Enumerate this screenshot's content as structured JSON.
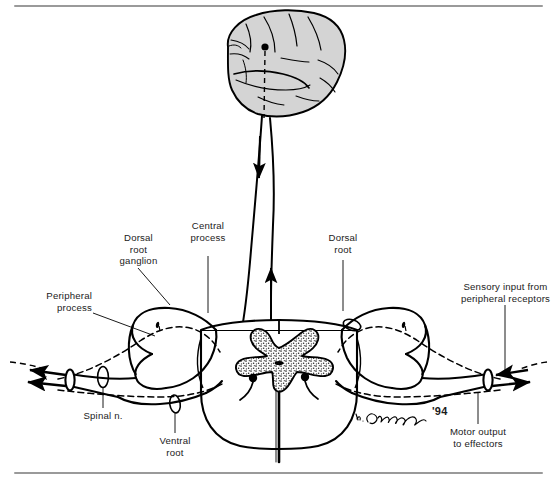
{
  "figure": {
    "signature": "d. Cummings",
    "signature_year": "'94",
    "colors": {
      "ink": "#000000",
      "brain_fill": "#d4d4d4",
      "gray_matter_fill": "#7d7d7d",
      "rule": "#9a9a9a",
      "paper": "#ffffff"
    }
  },
  "labels": [
    {
      "id": "dorsal-root-ganglion",
      "text_lines": [
        "Dorsal",
        "root",
        "ganglion"
      ],
      "align": "center"
    },
    {
      "id": "central-process",
      "text_lines": [
        "Central",
        "process"
      ],
      "align": "center"
    },
    {
      "id": "dorsal-root",
      "text_lines": [
        "Dorsal",
        "root"
      ],
      "align": "center"
    },
    {
      "id": "sensory-input",
      "text_lines": [
        "Sensory input from",
        "peripheral receptors"
      ],
      "align": "center"
    },
    {
      "id": "peripheral-process",
      "text_lines": [
        "Peripheral",
        "process"
      ],
      "align": "right"
    },
    {
      "id": "spinal-nerve",
      "text_lines": [
        "Spinal n."
      ],
      "align": "center"
    },
    {
      "id": "ventral-root",
      "text_lines": [
        "Ventral",
        "root"
      ],
      "align": "center"
    },
    {
      "id": "motor-output",
      "text_lines": [
        "Motor output",
        "to effectors"
      ],
      "align": "center"
    }
  ],
  "label_text": {
    "dorsal_root_ganglion_l1": "Dorsal",
    "dorsal_root_ganglion_l2": "root",
    "dorsal_root_ganglion_l3": "ganglion",
    "central_process_l1": "Central",
    "central_process_l2": "process",
    "dorsal_root_l1": "Dorsal",
    "dorsal_root_l2": "root",
    "sensory_input_l1": "Sensory input from",
    "sensory_input_l2": "peripheral receptors",
    "peripheral_process_l1": "Peripheral",
    "peripheral_process_l2": "process",
    "spinal_nerve_l1": "Spinal n.",
    "ventral_root_l1": "Ventral",
    "ventral_root_l2": "root",
    "motor_output_l1": "Motor output",
    "motor_output_l2": "to effectors",
    "signature": "d. Cummings",
    "year": "'94"
  },
  "anatomy": {
    "structures": [
      "cerebrum",
      "descending-motor-tract",
      "ascending-sensory-tract",
      "spinal-cord-cross-section",
      "gray-matter-butterfly",
      "dorsal-root-ganglion-left",
      "dorsal-root-ganglion-right",
      "dorsal-root-left",
      "dorsal-root-right",
      "ventral-root-left",
      "ventral-root-right",
      "spinal-nerve-left",
      "spinal-nerve-right",
      "central-canal"
    ],
    "neuron_somata": [
      "cortical-neuron-soma",
      "ventral-horn-motor-neuron-left",
      "ventral-horn-motor-neuron-right",
      "dorsal-root-ganglion-soma-left",
      "dorsal-root-ganglion-soma-right"
    ],
    "flow_arrows": [
      {
        "id": "descending-arrow",
        "direction": "down",
        "meaning": "motor command from brain"
      },
      {
        "id": "ascending-arrow",
        "direction": "up",
        "meaning": "sensory signal to brain"
      },
      {
        "id": "sensory-in-left",
        "direction": "left-out",
        "meaning": "peripheral receptor field"
      },
      {
        "id": "motor-out-left",
        "direction": "left-out",
        "meaning": "to effector muscle"
      },
      {
        "id": "sensory-in-right",
        "direction": "left-in",
        "meaning": "sensory input from receptors"
      },
      {
        "id": "motor-out-right",
        "direction": "right-out",
        "meaning": "motor output to effectors"
      }
    ]
  }
}
